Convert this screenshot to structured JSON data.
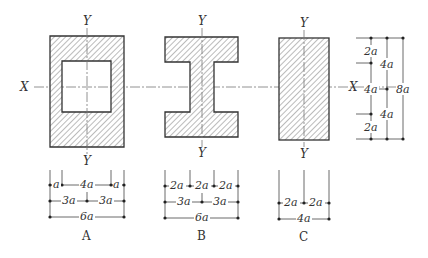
{
  "figure": {
    "axis_labels": {
      "x_left": "X",
      "x_right": "X",
      "y_top": "Y",
      "y_bottom": "Y"
    },
    "sections": [
      {
        "id": "A",
        "caption": "A",
        "shape": "hollow rectangle",
        "dims": {
          "row1": [
            "a",
            "4a",
            "a"
          ],
          "row2": [
            "3a",
            "3a"
          ],
          "row3": [
            "6a"
          ]
        }
      },
      {
        "id": "B",
        "caption": "B",
        "shape": "I-section",
        "dims": {
          "row1": [
            "2a",
            "2a",
            "2a"
          ],
          "row2": [
            "3a",
            "3a"
          ],
          "row3": [
            "6a"
          ]
        }
      },
      {
        "id": "C",
        "caption": "C",
        "shape": "solid rectangle",
        "dims": {
          "row1": [
            "2a",
            "2a"
          ],
          "row2": [
            "4a"
          ]
        }
      }
    ],
    "vertical_dims": {
      "col1": [
        "2a",
        "4a",
        "2a"
      ],
      "col2": [
        "4a",
        "4a"
      ],
      "col3": [
        "8a"
      ]
    }
  }
}
